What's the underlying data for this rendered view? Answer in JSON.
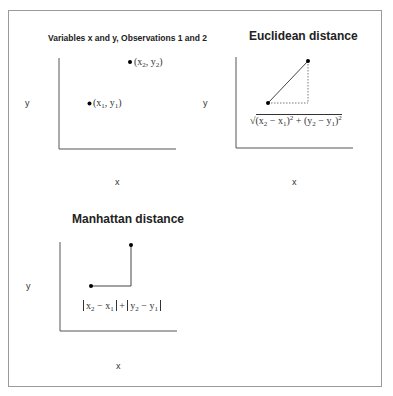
{
  "panels": [
    {
      "id": "observations",
      "title": "Variables x and y, Observations 1 and 2",
      "x_label": "x",
      "y_label": "y",
      "points": [
        {
          "label_base_x": "x",
          "label_sub_x": "1",
          "label_base_y": "y",
          "label_sub_y": "1"
        },
        {
          "label_base_x": "x",
          "label_sub_x": "2",
          "label_base_y": "y",
          "label_sub_y": "2"
        }
      ]
    },
    {
      "id": "euclidean",
      "title": "Euclidean distance",
      "x_label": "x",
      "y_label": "y",
      "formula_text": "√((x₂ − x₁)² + (y₂ − y₁)²)"
    },
    {
      "id": "manhattan",
      "title": "Manhattan distance",
      "x_label": "x",
      "y_label": "y",
      "formula_text": "|x₂ − x₁| + |y₂ − y₁|"
    }
  ],
  "glyphs": {
    "open_paren": "(",
    "close_paren": ")",
    "comma": ", ",
    "minus": " − ",
    "plus": " + ",
    "two": "2",
    "one": "1"
  },
  "colors": {
    "axis": "#555555",
    "line": "#444444",
    "point": "#000000",
    "frame": "#9a9a9a"
  }
}
